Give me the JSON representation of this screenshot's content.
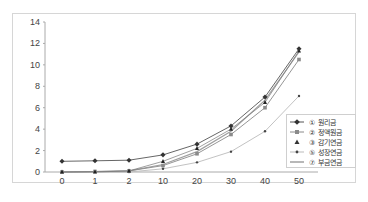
{
  "chart_data": {
    "type": "line",
    "title": "",
    "xlabel": "",
    "ylabel": "",
    "categories": [
      "0",
      "1",
      "2",
      "10",
      "20",
      "30",
      "40",
      "50"
    ],
    "yticks": [
      0,
      2,
      4,
      6,
      8,
      10,
      12,
      14
    ],
    "ylim": [
      0,
      14
    ],
    "grid": false,
    "legend_position": "lower right (inside)",
    "series": [
      {
        "name": "① 원리금",
        "color": "#555555",
        "marker": "diamond",
        "values": [
          1.0,
          1.05,
          1.1,
          1.6,
          2.6,
          4.3,
          7.0,
          11.5
        ]
      },
      {
        "name": "② 정액원금",
        "color": "#8a8a8a",
        "marker": "square",
        "values": [
          0.0,
          0.05,
          0.1,
          0.6,
          1.7,
          3.5,
          6.0,
          10.5
        ]
      },
      {
        "name": "③ 감기연금",
        "color": "#333333",
        "marker": "triangle",
        "values": [
          0.0,
          0.0,
          0.1,
          1.0,
          2.2,
          4.0,
          6.5,
          11.3
        ]
      },
      {
        "name": "⑤ 성장연금",
        "color": "#bbbbbb",
        "marker": "dot",
        "values": [
          0.0,
          0.0,
          0.0,
          0.3,
          0.9,
          1.9,
          3.8,
          7.1
        ]
      },
      {
        "name": "⑦ 부금연금",
        "color": "#a0a0a0",
        "marker": "none",
        "values": [
          0.0,
          0.05,
          0.1,
          0.7,
          1.9,
          3.8,
          6.7,
          11.2
        ]
      }
    ]
  },
  "legend": {
    "items": [
      {
        "label": "① 원리금"
      },
      {
        "label": "② 정액원금"
      },
      {
        "label": "③ 감기연금"
      },
      {
        "label": "⑤ 성장연금"
      },
      {
        "label": "⑦ 부금연금"
      }
    ]
  }
}
